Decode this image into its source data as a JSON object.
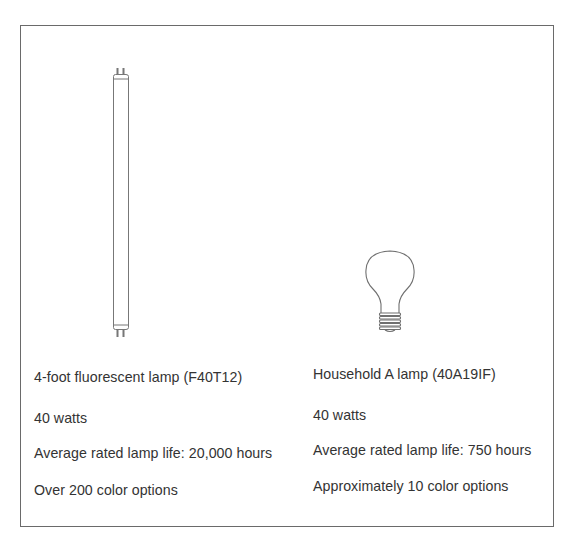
{
  "figure": {
    "left_item": {
      "illustration": "fluorescent-tube-icon",
      "name": "4-foot fluorescent lamp (F40T12)",
      "wattage": "40 watts",
      "lamp_life": "Average rated lamp life: 20,000 hours",
      "color_options": "Over 200 color options"
    },
    "right_item": {
      "illustration": "incandescent-bulb-icon",
      "name": "Household A lamp (40A19IF)",
      "wattage": "40 watts",
      "lamp_life": "Average rated lamp life: 750 hours",
      "color_options": "Approximately 10 color options"
    },
    "colors": {
      "border": "#6a6a6a",
      "line_art": "#777777",
      "text": "#333333",
      "background": "#ffffff"
    }
  }
}
